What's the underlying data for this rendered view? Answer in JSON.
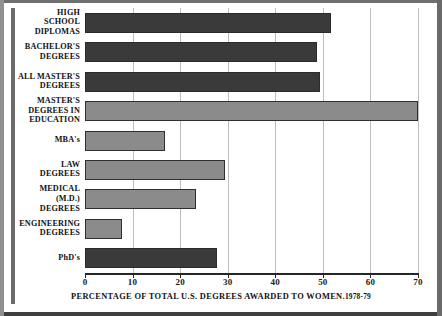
{
  "chart_data": {
    "type": "bar",
    "orientation": "horizontal",
    "title": "",
    "xlabel": "PERCENTAGE OF TOTAL U.S. DEGREES AWARDED TO WOMEN.",
    "xlabel_year": "1978-79",
    "ylabel": "",
    "xlim": [
      0,
      70
    ],
    "xticks": [
      0,
      10,
      20,
      30,
      40,
      50,
      60,
      70
    ],
    "xtick_labels": [
      "0",
      "10",
      "20",
      "30",
      "40",
      "50",
      "60",
      "70"
    ],
    "grid": true,
    "grid_axis": "x",
    "legend": false,
    "categories": [
      "HIGH SCHOOL DIPLOMAS",
      "BACHELOR'S DEGREES",
      "ALL MASTER'S DEGREES",
      "MASTER'S DEGREES IN EDUCATION",
      "MBA's",
      "LAW DEGREES",
      "MEDICAL (M.D.) DEGREES",
      "ENGINEERING DEGREES",
      "PhD's"
    ],
    "category_lines": [
      [
        "HIGH",
        "SCHOOL",
        "DIPLOMAS"
      ],
      [
        "BACHELOR'S",
        "DEGREES"
      ],
      [
        "ALL MASTER'S",
        "DEGREES"
      ],
      [
        "MASTER'S",
        "DEGREES IN",
        "EDUCATION"
      ],
      [
        "MBA's"
      ],
      [
        "LAW",
        "DEGREES"
      ],
      [
        "MEDICAL",
        "(M.D.)",
        "DEGREES"
      ],
      [
        "ENGINEERING",
        "DEGREES"
      ],
      [
        "PhD's"
      ]
    ],
    "values": [
      51.7,
      48.8,
      49.4,
      70.0,
      16.8,
      29.4,
      23.4,
      7.8,
      27.8
    ],
    "bar_colors": [
      "#3a3a3a",
      "#3a3a3a",
      "#3a3a3a",
      "#8b8b8b",
      "#8b8b8b",
      "#8b8b8b",
      "#8b8b8b",
      "#8b8b8b",
      "#3a3a3a"
    ],
    "bar_shades": [
      "dark",
      "dark",
      "dark",
      "light",
      "light",
      "light",
      "light",
      "light",
      "dark"
    ]
  },
  "colors": {
    "background": "#ffffff",
    "dark_bar": "#3a3a3a",
    "light_bar": "#8b8b8b",
    "gridline": "#bdbdbd",
    "axis": "#262626",
    "text": "#111111"
  }
}
